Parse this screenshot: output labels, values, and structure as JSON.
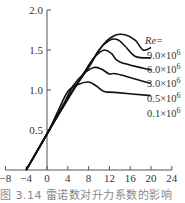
{
  "chart_data": {
    "type": "line",
    "title": "",
    "caption": "图 3.14   雷诺数对升力系数的影响",
    "xlabel": "",
    "ylabel": "",
    "xlim": [
      -8,
      24
    ],
    "ylim": [
      0,
      2.0
    ],
    "x_ticks": [
      "-8",
      "-4",
      "0",
      "4",
      "8",
      "12",
      "16",
      "20",
      "24"
    ],
    "y_ticks": [
      "0.5",
      "1.0",
      "1.5",
      "2.0"
    ],
    "legend_title": "Re=",
    "grid": false,
    "series": [
      {
        "name": "9.0×10^6",
        "label": "9.0×10",
        "exp": "6",
        "points": [
          [
            -4,
            0
          ],
          [
            0,
            0.45
          ],
          [
            4,
            0.9
          ],
          [
            8,
            1.3
          ],
          [
            11,
            1.58
          ],
          [
            13,
            1.68
          ],
          [
            15,
            1.69
          ],
          [
            17,
            1.62
          ],
          [
            18.5,
            1.5
          ],
          [
            20,
            1.53
          ]
        ]
      },
      {
        "name": "6.0×10^6",
        "label": "6.0×10",
        "exp": "6",
        "points": [
          [
            -4,
            0
          ],
          [
            0,
            0.45
          ],
          [
            4,
            0.9
          ],
          [
            8,
            1.28
          ],
          [
            10,
            1.5
          ],
          [
            12,
            1.62
          ],
          [
            13.5,
            1.63
          ],
          [
            15,
            1.55
          ],
          [
            17,
            1.42
          ],
          [
            20,
            1.4
          ]
        ]
      },
      {
        "name": "3.0×10^6",
        "label": "3.0×10",
        "exp": "6",
        "points": [
          [
            -4,
            0
          ],
          [
            0,
            0.45
          ],
          [
            4,
            0.88
          ],
          [
            7,
            1.2
          ],
          [
            9,
            1.4
          ],
          [
            11,
            1.5
          ],
          [
            12.5,
            1.45
          ],
          [
            14,
            1.35
          ],
          [
            20,
            1.25
          ]
        ]
      },
      {
        "name": "0.5×10^6",
        "label": "0.5×10",
        "exp": "6",
        "points": [
          [
            -4,
            0
          ],
          [
            0,
            0.45
          ],
          [
            3,
            0.8
          ],
          [
            5,
            1.05
          ],
          [
            7,
            1.2
          ],
          [
            9,
            1.28
          ],
          [
            10.5,
            1.26
          ],
          [
            12,
            1.2
          ],
          [
            13.5,
            1.2
          ],
          [
            20,
            1.08
          ]
        ]
      },
      {
        "name": "0.1×10^6",
        "label": "0.1×10",
        "exp": "6",
        "points": [
          [
            -4,
            0
          ],
          [
            0,
            0.45
          ],
          [
            2,
            0.72
          ],
          [
            4,
            0.98
          ],
          [
            6,
            1.07
          ],
          [
            8,
            1.1
          ],
          [
            9.5,
            1.05
          ],
          [
            11,
            0.98
          ],
          [
            13,
            0.97
          ],
          [
            20,
            0.93
          ]
        ]
      }
    ]
  }
}
